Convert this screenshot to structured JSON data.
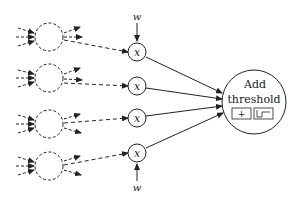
{
  "diagram": {
    "type": "neural-network-neuron",
    "weights": [
      {
        "label": "w",
        "position": "top"
      },
      {
        "label": "w",
        "position": "bottom"
      }
    ],
    "multiply_nodes": [
      {
        "label": "x"
      },
      {
        "label": "x"
      },
      {
        "label": "x"
      },
      {
        "label": "x"
      }
    ],
    "input_neurons_count": 4,
    "sum_node": {
      "line1": "Add",
      "line2": "threshold",
      "box_plus": "+",
      "box_step_icon": "step-function-icon"
    },
    "colors": {
      "stroke": "#222222",
      "background": "#ffffff"
    }
  }
}
